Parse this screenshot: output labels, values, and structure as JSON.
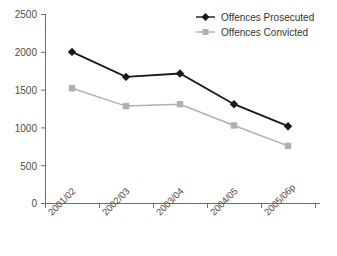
{
  "chart_data": {
    "type": "line",
    "title": "",
    "subtitle": "",
    "xlabel": "",
    "ylabel": "",
    "categories": [
      "2001/02",
      "2002/03",
      "2003/04",
      "2004/05",
      "2005/06p"
    ],
    "series": [
      {
        "name": "Offences Prosecuted",
        "values": [
          2000,
          1670,
          1715,
          1310,
          1020
        ],
        "color": "#1a1a1a",
        "marker": "diamond"
      },
      {
        "name": "Offences Convicted",
        "values": [
          1520,
          1285,
          1310,
          1030,
          760
        ],
        "color": "#b0b0b0",
        "marker": "square"
      }
    ],
    "ylim": [
      0,
      2500
    ],
    "y_ticks": [
      0,
      500,
      1000,
      1500,
      2000,
      2500
    ],
    "y_tick_labels": [
      "0",
      "500",
      "1000",
      "1500",
      "2000",
      "2500"
    ],
    "grid": false,
    "legend_position": "top-right",
    "x_tick_label_rotation": -45
  },
  "axis": {
    "y_labels": [
      "2500",
      "2000",
      "1500",
      "1000",
      "500",
      "0"
    ],
    "x_labels": [
      "2001/02",
      "2002/03",
      "2003/04",
      "2004/05",
      "2005/06p"
    ]
  },
  "legend": {
    "entries": [
      {
        "label": "Offences Prosecuted",
        "icon": "diamond-marker-icon"
      },
      {
        "label": "Offences Convicted",
        "icon": "square-marker-icon"
      }
    ]
  },
  "colors": {
    "prosecuted": "#1a1a1a",
    "convicted": "#b0b0b0",
    "axis": "#6e6e6e",
    "text": "#4d4d4d",
    "background": "#ffffff"
  }
}
